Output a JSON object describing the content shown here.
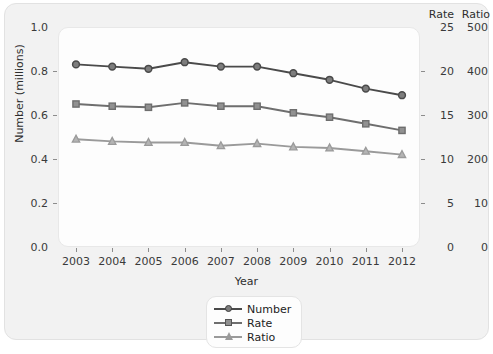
{
  "chart_data": {
    "type": "line",
    "title": "",
    "xlabel": "Year",
    "ylabel": "Number (millions)",
    "categories": [
      "2003",
      "2004",
      "2005",
      "2006",
      "2007",
      "2008",
      "2009",
      "2010",
      "2011",
      "2012"
    ],
    "grid": false,
    "legend_position": "bottom-center",
    "axes": {
      "left": {
        "label": "Number (millions)",
        "ticks": [
          "1.0",
          "0.8",
          "0.6",
          "0.4",
          "0.2",
          "0.0"
        ],
        "tick_values": [
          1.0,
          0.8,
          0.6,
          0.4,
          0.2,
          0.0
        ],
        "ylim": [
          0.0,
          1.0
        ]
      },
      "right_rate": {
        "header": "Rate",
        "ticks": [
          "25",
          "20",
          "15",
          "10",
          "5",
          "0"
        ],
        "tick_values": [
          25,
          20,
          15,
          10,
          5,
          0
        ],
        "ylim": [
          0,
          25
        ]
      },
      "right_ratio": {
        "header": "Ratio",
        "ticks": [
          "500",
          "400",
          "300",
          "200",
          "10",
          "0"
        ],
        "tick_values": [
          500,
          400,
          300,
          200,
          10,
          0
        ],
        "ylim": [
          0,
          500
        ]
      }
    },
    "series": [
      {
        "name": "Number",
        "marker": "circle",
        "color": "#4a4a4a",
        "axis": "left",
        "values": [
          0.83,
          0.82,
          0.81,
          0.84,
          0.82,
          0.82,
          0.79,
          0.76,
          0.72,
          0.69
        ]
      },
      {
        "name": "Rate",
        "marker": "square",
        "color": "#6e6e6e",
        "axis": "left",
        "values": [
          0.65,
          0.64,
          0.635,
          0.655,
          0.64,
          0.64,
          0.61,
          0.59,
          0.56,
          0.53
        ]
      },
      {
        "name": "Ratio",
        "marker": "triangle",
        "color": "#9a9a9a",
        "axis": "left",
        "values": [
          0.49,
          0.48,
          0.475,
          0.475,
          0.46,
          0.47,
          0.455,
          0.45,
          0.435,
          0.42
        ]
      }
    ]
  },
  "legend": {
    "items": [
      {
        "label": "Number"
      },
      {
        "label": "Rate"
      },
      {
        "label": "Ratio"
      }
    ]
  },
  "colors": {
    "panel_background": "#f2f2f2",
    "plot_background": "#fdfdfd",
    "axis_text": "#3a3a3a",
    "series_number": "#4a4a4a",
    "series_rate": "#6e6e6e",
    "series_ratio": "#9a9a9a"
  }
}
